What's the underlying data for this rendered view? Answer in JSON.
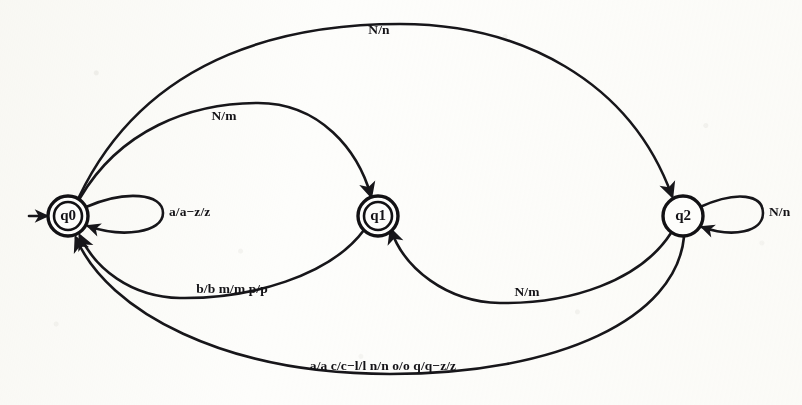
{
  "diagram": {
    "type": "state-transition-diagram",
    "ink_color": "#17161a",
    "paper_color": "#fdfdfb",
    "states": [
      {
        "id": "q0",
        "label": "q0",
        "accepting": true,
        "start": true,
        "cx": 68,
        "cy": 216,
        "r_outer": 20,
        "r_inner": 14
      },
      {
        "id": "q1",
        "label": "q1",
        "accepting": true,
        "start": false,
        "cx": 378,
        "cy": 216,
        "r_outer": 20,
        "r_inner": 14
      },
      {
        "id": "q2",
        "label": "q2",
        "accepting": false,
        "start": false,
        "cx": 683,
        "cy": 216,
        "r_outer": 20,
        "r_inner": 0
      }
    ],
    "self_loops": [
      {
        "state": "q0",
        "label": "a/a−z/z",
        "label_x": 169,
        "label_y": 213
      },
      {
        "state": "q2",
        "label": "N/n",
        "label_x": 769,
        "label_y": 213
      }
    ],
    "transitions": [
      {
        "id": "t_q0_q2",
        "from": "q0",
        "to": "q2",
        "label": "N/n",
        "label_x": 379,
        "label_y": 31
      },
      {
        "id": "t_q0_q1",
        "from": "q0",
        "to": "q1",
        "label": "N/m",
        "label_x": 224,
        "label_y": 117
      },
      {
        "id": "t_q1_q0",
        "from": "q1",
        "to": "q0",
        "label": "b/b m/m p/p",
        "label_x": 232,
        "label_y": 290
      },
      {
        "id": "t_q2_q1",
        "from": "q2",
        "to": "q1",
        "label": "N/m",
        "label_x": 527,
        "label_y": 293
      },
      {
        "id": "t_q2_q0",
        "from": "q2",
        "to": "q0",
        "label": "a/a c/c−l/l n/n o/o q/q−z/z",
        "label_x": 383,
        "label_y": 367
      }
    ],
    "start_marker": {
      "state": "q0",
      "x": 30,
      "y": 216
    }
  }
}
